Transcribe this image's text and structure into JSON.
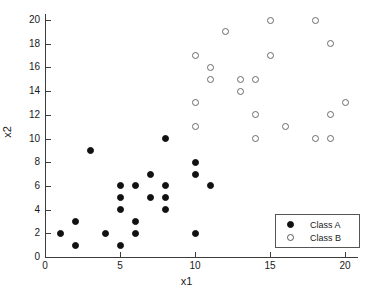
{
  "chart_data": {
    "type": "scatter",
    "title": "",
    "xlabel": "x1",
    "ylabel": "x2",
    "xlim": [
      0,
      21
    ],
    "ylim": [
      0,
      21
    ],
    "xticks": [
      0,
      5,
      10,
      15,
      20
    ],
    "yticks": [
      0,
      2,
      4,
      6,
      8,
      10,
      12,
      14,
      16,
      18,
      20
    ],
    "xtick_labels": [
      "0",
      "5",
      "10",
      "15",
      "20"
    ],
    "ytick_labels": [
      "0",
      "2",
      "4",
      "6",
      "8",
      "10",
      "12",
      "14",
      "16",
      "18",
      "20"
    ],
    "grid": false,
    "legend_position": "lower right",
    "series": [
      {
        "name": "Class A",
        "marker": "filled-circle",
        "color": "#111111",
        "points": [
          [
            1,
            2
          ],
          [
            2,
            3
          ],
          [
            2,
            1
          ],
          [
            3,
            9
          ],
          [
            4,
            2
          ],
          [
            5,
            6
          ],
          [
            5,
            5
          ],
          [
            5,
            4
          ],
          [
            5,
            1
          ],
          [
            6,
            6
          ],
          [
            6,
            3
          ],
          [
            6,
            2
          ],
          [
            7,
            7
          ],
          [
            7,
            5
          ],
          [
            8,
            10
          ],
          [
            8,
            6
          ],
          [
            8,
            5
          ],
          [
            8,
            4
          ],
          [
            10,
            8
          ],
          [
            10,
            7
          ],
          [
            10,
            2
          ],
          [
            11,
            6
          ]
        ]
      },
      {
        "name": "Class B",
        "marker": "open-circle",
        "color": "#6a6a6a",
        "points": [
          [
            10,
            17
          ],
          [
            10,
            13
          ],
          [
            10,
            11
          ],
          [
            11,
            16
          ],
          [
            11,
            15
          ],
          [
            12,
            19
          ],
          [
            13,
            15
          ],
          [
            13,
            14
          ],
          [
            14,
            15
          ],
          [
            14,
            12
          ],
          [
            14,
            10
          ],
          [
            15,
            20
          ],
          [
            15,
            17
          ],
          [
            16,
            11
          ],
          [
            18,
            20
          ],
          [
            18,
            10
          ],
          [
            19,
            18
          ],
          [
            19,
            12
          ],
          [
            19,
            10
          ],
          [
            20,
            13
          ]
        ]
      }
    ]
  },
  "legend": {
    "entries": [
      {
        "label": "Class A",
        "marker": "filled-circle"
      },
      {
        "label": "Class B",
        "marker": "open-circle"
      }
    ]
  },
  "colors": {
    "axis": "#3c3c3c",
    "text": "#1a1a1a",
    "class_a": "#111111",
    "class_b": "#6a6a6a",
    "background": "#ffffff"
  }
}
